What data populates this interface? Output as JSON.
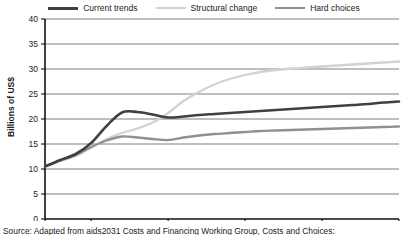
{
  "chart_data": {
    "type": "line",
    "title": "",
    "xlabel": "",
    "ylabel": "Billions of US$",
    "xlim": [
      2007,
      2030
    ],
    "ylim": [
      0,
      40
    ],
    "grid": true,
    "legend_position": "top",
    "xticks": [
      "2007",
      "2010",
      "2015",
      "2020",
      "2025",
      "2030"
    ],
    "xtick_values": [
      2007,
      2010,
      2015,
      2020,
      2025,
      2030
    ],
    "yticks": [
      "0",
      "5",
      "10",
      "15",
      "20",
      "25",
      "30",
      "35",
      "40"
    ],
    "ytick_values": [
      0,
      5,
      10,
      15,
      20,
      25,
      30,
      35,
      40
    ],
    "x": [
      2007,
      2008,
      2009,
      2010,
      2011,
      2012,
      2013,
      2014,
      2015,
      2016,
      2017,
      2018,
      2019,
      2020,
      2021,
      2022,
      2023,
      2024,
      2025,
      2026,
      2027,
      2028,
      2029,
      2030
    ],
    "series": [
      {
        "name": "Current trends",
        "color": "#404040",
        "width": 2.6,
        "values": [
          10.5,
          11.8,
          13.0,
          15.2,
          18.6,
          21.3,
          21.4,
          20.9,
          20.3,
          20.5,
          20.8,
          21.0,
          21.2,
          21.4,
          21.6,
          21.8,
          22.0,
          22.2,
          22.4,
          22.6,
          22.8,
          23.0,
          23.3,
          23.5
        ]
      },
      {
        "name": "Structural change",
        "color": "#d2d2d2",
        "width": 2.3,
        "values": [
          10.4,
          11.6,
          12.6,
          14.3,
          16.0,
          17.2,
          18.1,
          19.3,
          21.2,
          23.6,
          25.4,
          26.9,
          28.0,
          28.8,
          29.4,
          29.8,
          30.1,
          30.3,
          30.5,
          30.7,
          30.9,
          31.1,
          31.3,
          31.5
        ]
      },
      {
        "name": "Hard choices",
        "color": "#909090",
        "width": 2.3,
        "values": [
          10.5,
          11.7,
          12.8,
          14.4,
          15.7,
          16.5,
          16.3,
          16.0,
          15.8,
          16.3,
          16.7,
          17.0,
          17.2,
          17.4,
          17.6,
          17.7,
          17.8,
          17.9,
          18.0,
          18.1,
          18.2,
          18.3,
          18.4,
          18.5
        ]
      }
    ]
  },
  "legend": {
    "items": [
      {
        "label": "Current trends"
      },
      {
        "label": "Structural change"
      },
      {
        "label": "Hard choices"
      }
    ]
  },
  "caption": {
    "text": "Source: Adapted from aids2031 Costs and Financing Working Group, Costs and Choices:"
  }
}
